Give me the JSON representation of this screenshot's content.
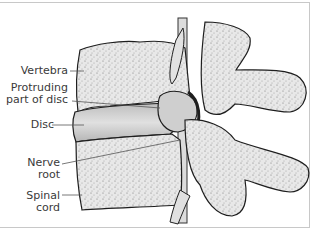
{
  "diagram": {
    "labels": [
      {
        "id": "vertebra",
        "line1": "Vertebra",
        "line2": ""
      },
      {
        "id": "protruding",
        "line1": "Protruding",
        "line2": "part of disc"
      },
      {
        "id": "disc",
        "line1": "Disc",
        "line2": ""
      },
      {
        "id": "nerve",
        "line1": "Nerve",
        "line2": "root"
      },
      {
        "id": "spinal",
        "line1": "Spinal",
        "line2": "cord"
      }
    ],
    "colors": {
      "background": "#ffffff",
      "bone_fill": "#e6e6e6",
      "bone_shadow": "#8a8a8a",
      "outline": "#1e1e1e",
      "disc_fill": "#d0d0d0",
      "label_text": "#3a3a3a",
      "frame": "#c8c8c8"
    }
  }
}
